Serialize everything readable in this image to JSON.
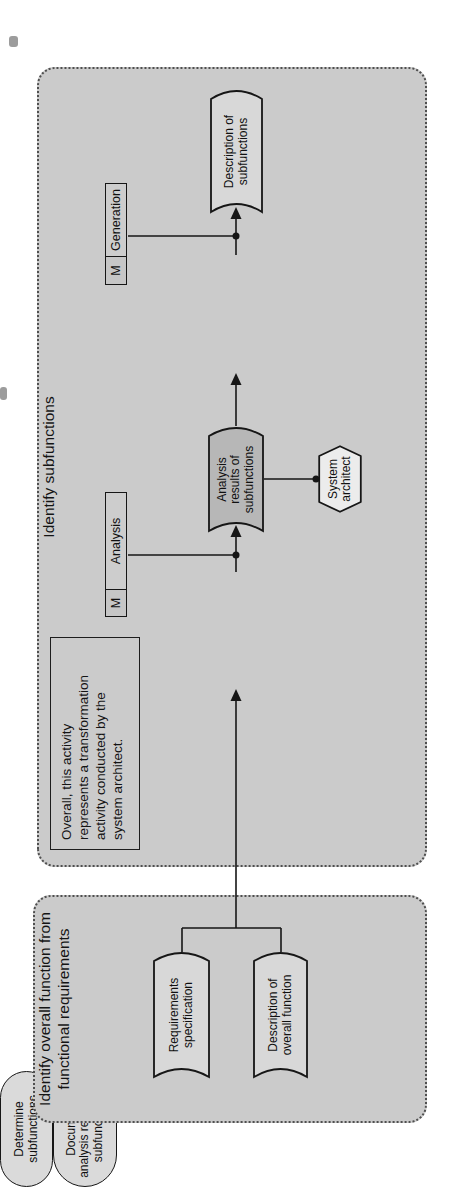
{
  "figure": {
    "left_container": {
      "title": "Identify overall function from\nfunctional requirements",
      "stores": [
        {
          "label": "Requirements\nspecification"
        },
        {
          "label": "Description of\noverall function"
        }
      ]
    },
    "right_container": {
      "title": "Identify subfunctions",
      "note": "Overall, this activity\nrepresents a transformation\nactivity conducted by the\nsystem architect.",
      "activities": [
        {
          "label": "Determine\nsubfunctions"
        },
        {
          "label": "Document\nanalysis results on\nsubfunctions"
        }
      ],
      "stores": [
        {
          "label": "Analysis\nresults of\nsubfunctions"
        },
        {
          "label": "Description of\nsubfunctions"
        }
      ],
      "methods": [
        {
          "m": "M",
          "label": "Analysis"
        },
        {
          "m": "M",
          "label": "Generation"
        }
      ],
      "actor": {
        "label": "System\narchitect"
      }
    },
    "colors": {
      "container_fill": "#cbcbcb",
      "container_border": "#4f4f4f",
      "store_fill": "#d8d8d8",
      "activity_fill": "#dadada",
      "highlight_store_fill": "#b7b7b7",
      "actor_fill": "#ececec",
      "method_fill": "#cdcdcd",
      "line": "#161616"
    }
  }
}
